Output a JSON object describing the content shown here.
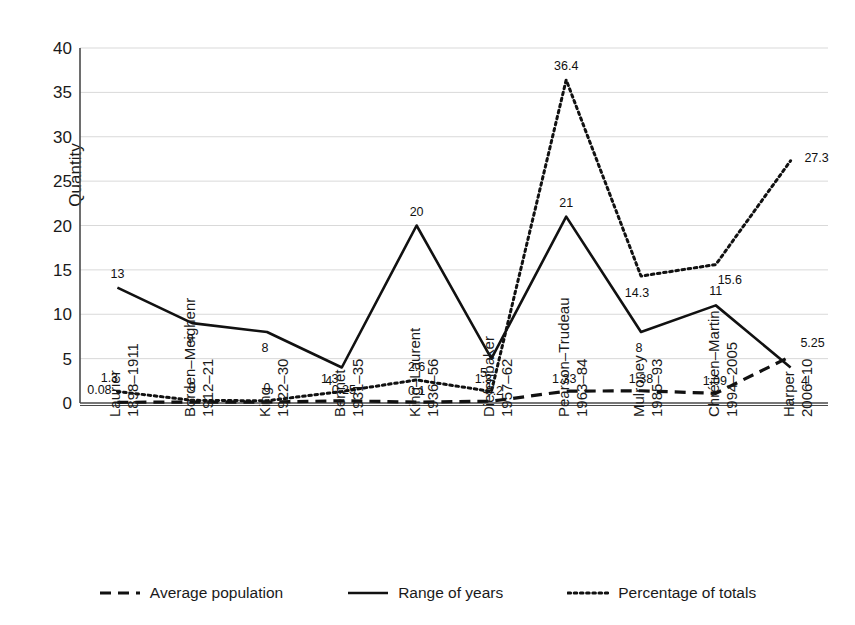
{
  "chart_data": {
    "type": "line",
    "title": "",
    "xlabel": "",
    "ylabel": "Quantity",
    "ylim": [
      0,
      40
    ],
    "yticks": [
      0,
      5,
      10,
      15,
      20,
      25,
      30,
      35,
      40
    ],
    "grid": true,
    "legend_position": "bottom",
    "categories": [
      "Laurier 1898–11911",
      "Borden–Meighenr 1912–21",
      "King 1922–30",
      "Bennet 1931–35",
      "King–Laurent 1936–56",
      "Diefenbaker 1957–62",
      "Pearson–Trudeau 1963–84",
      "Mulroney 1985–93",
      "Chrétien–Martin 1994–2005",
      "Harper 2006–10"
    ],
    "category_lines": [
      [
        "Laurier",
        "1898–1911"
      ],
      [
        "Borden–Meighenr",
        "1912–21"
      ],
      [
        "King",
        "1922–30"
      ],
      [
        "Bennet",
        "1931–35"
      ],
      [
        "King–Laurent",
        "1936–56"
      ],
      [
        "Diefenbaker",
        "1957–62"
      ],
      [
        "Pearson–Trudeau",
        "1963–84"
      ],
      [
        "Mulroney",
        "1985–93"
      ],
      [
        "Chrétien–Martin",
        "1994–2005"
      ],
      [
        "Harper",
        "2006–10"
      ]
    ],
    "series": [
      {
        "name": "Average population",
        "style": "dashed",
        "color": "#111111",
        "values": [
          0.08,
          0.1,
          0.1,
          0.25,
          0.1,
          0.2,
          1.33,
          1.38,
          1.09,
          5.25
        ],
        "labels": [
          "0.08",
          "",
          "",
          "0.25",
          "0.1",
          "0.2",
          "1.33",
          "1.38",
          "1.09",
          "5.25"
        ]
      },
      {
        "name": "Range of years",
        "style": "solid",
        "color": "#111111",
        "values": [
          13,
          9,
          8,
          4,
          20,
          5,
          21,
          8,
          11,
          4
        ],
        "labels": [
          "13",
          "9",
          "8",
          "4",
          "20",
          "5",
          "21",
          "8",
          "11",
          "4"
        ]
      },
      {
        "name": "Percentage of totals",
        "style": "dotted",
        "color": "#111111",
        "values": [
          1.3,
          0.3,
          0.25,
          1.3,
          2.6,
          1.3,
          36.4,
          14.3,
          15.6,
          27.3
        ],
        "labels": [
          "1.3",
          "0",
          "0",
          "1.3",
          "2.6",
          "1.3",
          "36.4",
          "14.3",
          "15.6",
          "27.3"
        ]
      }
    ]
  },
  "legend": {
    "items": [
      {
        "label": "Average population",
        "style": "dashed"
      },
      {
        "label": "Range of years",
        "style": "solid"
      },
      {
        "label": "Percentage of totals",
        "style": "dotted"
      }
    ]
  },
  "colors": {
    "axis": "#4a4a4a",
    "grid": "#d9d9d9",
    "series": "#111111",
    "text": "#1a1a1a"
  }
}
